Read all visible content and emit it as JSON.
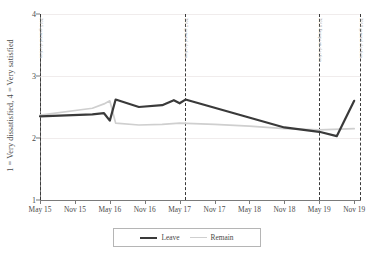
{
  "chart_data": {
    "type": "line",
    "title": "",
    "xlabel": "",
    "ylabel": "1 = Very dissatisfied, 4 = Very satisfied",
    "ylim": [
      1,
      4
    ],
    "yticks": [
      1,
      2,
      3,
      4
    ],
    "ytick_labels": [
      "1",
      "2",
      "3",
      "4"
    ],
    "grid": true,
    "legend_position": "bottom",
    "x_tick_labels": [
      "May 15",
      "Nov 15",
      "May 16",
      "Nov 16",
      "May 17",
      "Nov 17",
      "May 18",
      "Nov 18",
      "May 19",
      "Nov 19"
    ],
    "x": [
      "May 15",
      "Nov 15",
      "May 16",
      "Nov 16",
      "May 17",
      "Nov 17",
      "May 18",
      "Nov 18",
      "May 19",
      "Nov 19"
    ],
    "series": [
      {
        "name": "Leave",
        "color": "#3a3a3a",
        "points": [
          {
            "x": "May 15",
            "y": 2.35
          },
          {
            "x": "Feb 16",
            "y": 2.38
          },
          {
            "x": "Apr 16",
            "y": 2.4
          },
          {
            "x": "May 16",
            "y": 2.28
          },
          {
            "x": "Jun 16",
            "y": 2.62
          },
          {
            "x": "Oct 16",
            "y": 2.5
          },
          {
            "x": "Feb 17",
            "y": 2.53
          },
          {
            "x": "Apr 17",
            "y": 2.61
          },
          {
            "x": "May 17",
            "y": 2.56
          },
          {
            "x": "Jun 17",
            "y": 2.62
          },
          {
            "x": "Nov 18",
            "y": 2.17
          },
          {
            "x": "May 19",
            "y": 2.1
          },
          {
            "x": "Aug 19",
            "y": 2.03
          },
          {
            "x": "Nov 19",
            "y": 2.6
          }
        ]
      },
      {
        "name": "Remain",
        "color": "#cfcfcf",
        "points": [
          {
            "x": "May 15",
            "y": 2.37
          },
          {
            "x": "Feb 16",
            "y": 2.48
          },
          {
            "x": "Apr 16",
            "y": 2.55
          },
          {
            "x": "May 16",
            "y": 2.6
          },
          {
            "x": "Jun 16",
            "y": 2.24
          },
          {
            "x": "Oct 16",
            "y": 2.21
          },
          {
            "x": "Feb 17",
            "y": 2.22
          },
          {
            "x": "May 17",
            "y": 2.24
          },
          {
            "x": "Nov 17",
            "y": 2.22
          },
          {
            "x": "May 18",
            "y": 2.19
          },
          {
            "x": "Nov 18",
            "y": 2.15
          },
          {
            "x": "May 19",
            "y": 2.13
          },
          {
            "x": "Nov 19",
            "y": 2.15
          }
        ]
      }
    ],
    "annotations": [
      {
        "x": "May 15",
        "label": "2015 general election"
      },
      {
        "x": "Jun 17",
        "label": "2017 general election"
      },
      {
        "x": "May 19",
        "label": "2019 European election"
      },
      {
        "x": "Dec 19",
        "label": "2019 general election"
      }
    ]
  },
  "legend": {
    "items": [
      {
        "label": "Leave",
        "color": "#3a3a3a"
      },
      {
        "label": "Remain",
        "color": "#cfcfcf"
      }
    ]
  }
}
